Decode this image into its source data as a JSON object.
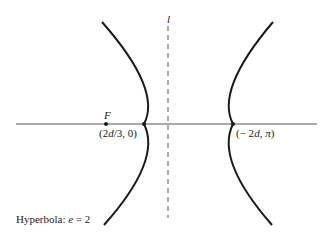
{
  "diagram": {
    "title": "Hyperbola: e = 2",
    "title_parts": {
      "prefix": "Hyperbola: ",
      "var": "e",
      "rest": " = 2"
    },
    "directrix_label": "l",
    "focus_label": "F",
    "focus_coords": "(2d/3, 0)",
    "focus_coords_parts": {
      "open": "(2",
      "var": "d",
      "rest": "/3, 0)"
    },
    "vertex_right_coords_parts": {
      "open": "(− 2",
      "var": "d",
      "comma": ", ",
      "pi": "π",
      "close": ")"
    },
    "vertex_right_coords": "(− 2d, π)",
    "colors": {
      "curve": "#1a1a1a",
      "axis": "#555555",
      "directrix": "#555555"
    }
  }
}
